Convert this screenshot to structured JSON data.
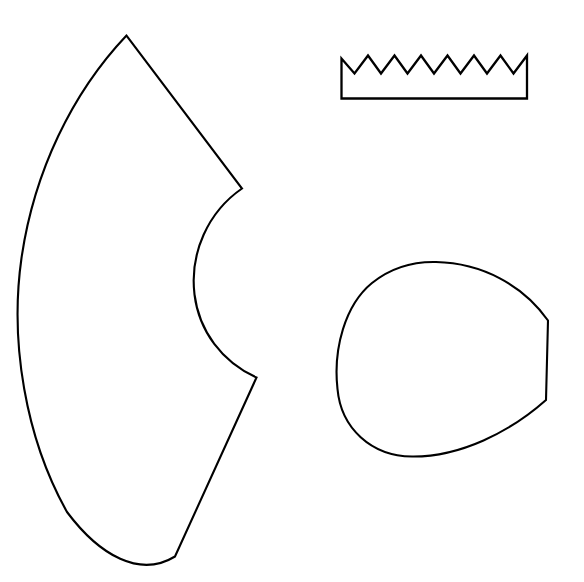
{
  "document": {
    "title": "Pattern Shapes Line Drawing",
    "type": "line-drawing",
    "background_color": "#ffffff",
    "stroke_color": "#000000",
    "width": 584,
    "height": 582
  },
  "shapes": [
    {
      "id": "cone-sector",
      "name": "Annulus sector / cone unroll pattern",
      "description": "Large curved wedge shape at left, an annular sector with outer arc, inner arc and two straight radial edges.",
      "stroke_width": 2.1,
      "path": "M 126.5,35.5 C 72,93 34,172 21.5,258 C 9.5,342 25.5,438 67,512 C 100,556 140,578 175,556.5 L 256.5,377.5 C 222,362 199,331 194.5,294.5 C 189.5,253 208,212 242,188.5 Z",
      "key_points": {
        "apex": [
          126.5,
          35.5
        ],
        "leftmost": [
          19.5,
          297
        ],
        "bottom_tip": [
          175,
          556.5
        ],
        "inner_lower_corner": [
          256.5,
          377.5
        ],
        "inner_upper_corner": [
          242,
          188.5
        ]
      }
    },
    {
      "id": "zigzag-strip",
      "name": "Zigzag-topped rectangular strip",
      "description": "Rectangle with a saw-tooth / zigzag upper edge of seven teeth.",
      "stroke_width": 2.3,
      "path": "M 341.5,98.5 L 341.5,58.5 L 354.5,73.5 L 368,55.5 L 381,73.5 L 394.5,55.5 L 407.5,73.5 L 421,55.5 L 434,73.5 L 447.5,55.5 L 460.5,73.5 L 474,55.5 L 487,73.5 L 500.5,55.5 L 513.5,73.5 L 527,55.5 L 527,98.5 Z",
      "teeth_count": 7,
      "key_points": {
        "left_edge_x": 341.5,
        "right_edge_x": 527,
        "bottom_y": 98.5,
        "peak_y": 55.5,
        "valley_y": 73.5
      }
    },
    {
      "id": "rounded-blob",
      "name": "Rounded blob with angled right facet",
      "description": "Near-circular closed shape with a flattened, angular facet along its right side forming two corner vertices.",
      "stroke_width": 2.1,
      "path": "M 436,262 C 482,263 523,285 548,320.5 L 546,400 C 510,432 460,457 412,456.5 C 371,456 341,428 337.5,389 C 333,349 345,305 372,283 C 390,268.5 413,261.5 436,262 Z",
      "key_points": {
        "top": [
          436,
          262
        ],
        "leftmost": [
          337.5,
          389
        ],
        "bottom": [
          412,
          456.5
        ],
        "upper_right_vertex": [
          548,
          320.5
        ],
        "lower_right_vertex": [
          546,
          400
        ]
      }
    }
  ]
}
